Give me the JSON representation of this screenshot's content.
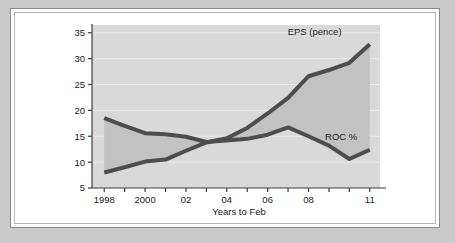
{
  "frame": {
    "page_background": "#c9c9c9",
    "card_background": "#ffffff",
    "card_border": "#8a8a8a"
  },
  "chart_data": {
    "type": "line",
    "title": "",
    "subtitle": "",
    "xlabel": "Years to Feb",
    "ylabel": "",
    "plot_background": "#d9d9d9",
    "band_fill": "#c4c4c4",
    "line_color": "#4d4d4d",
    "grid": true,
    "legend_position": "inline-annotation",
    "x": [
      1998,
      1999,
      2000,
      2001,
      2002,
      2003,
      2004,
      2005,
      2006,
      2007,
      2008,
      2009,
      2010,
      2011
    ],
    "x_tick_values": [
      1998,
      1999,
      2000,
      2001,
      2002,
      2003,
      2004,
      2005,
      2006,
      2007,
      2008,
      2009,
      2010,
      2011
    ],
    "x_tick_labels": [
      "1998",
      "",
      "2000",
      "",
      "02",
      "",
      "04",
      "",
      "06",
      "",
      "08",
      "",
      "",
      "11"
    ],
    "xlim": [
      1997.4,
      2011.5
    ],
    "y_tick_values": [
      5,
      10,
      15,
      20,
      25,
      30,
      35
    ],
    "y_tick_labels": [
      "5",
      "10",
      "15",
      "20",
      "25",
      "30",
      "35"
    ],
    "ylim": [
      5,
      36.5
    ],
    "series": [
      {
        "name": "EPS (pence)",
        "label": "EPS (pence)",
        "units": "pence",
        "values": [
          8.0,
          9.0,
          10.1,
          10.5,
          12.2,
          13.8,
          14.6,
          16.6,
          19.4,
          22.4,
          26.6,
          27.8,
          29.2,
          32.8
        ]
      },
      {
        "name": "ROC %",
        "label": "ROC %",
        "units": "%",
        "values": [
          18.5,
          17.0,
          15.6,
          15.4,
          14.9,
          13.9,
          14.2,
          14.5,
          15.3,
          16.7,
          15.0,
          13.2,
          10.6,
          12.4
        ]
      }
    ],
    "annotations": [
      {
        "text": "EPS (pence)",
        "for_series": "EPS (pence)",
        "x": 2008.3,
        "y": 34.6
      },
      {
        "text": "ROC %",
        "for_series": "ROC %",
        "x": 2009.6,
        "y": 14.2
      }
    ]
  }
}
